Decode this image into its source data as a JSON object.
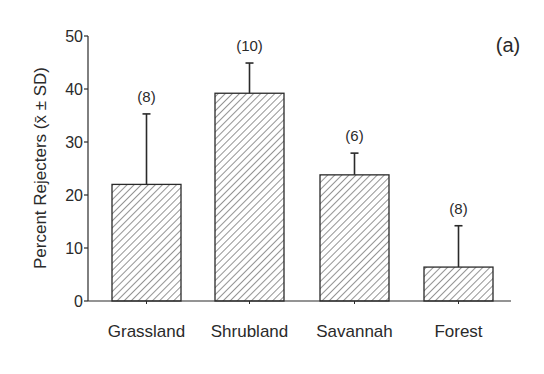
{
  "chart_data": {
    "type": "bar",
    "title": "",
    "panel_label": "(a)",
    "xlabel": "",
    "ylabel": "Percent Rejecters (x̄ ± SD)",
    "ylim": [
      0,
      50
    ],
    "yticks": [
      0,
      10,
      20,
      30,
      40,
      50
    ],
    "ytick_labels": [
      "0",
      "10",
      "20",
      "30",
      "40",
      "50"
    ],
    "grid": false,
    "legend": null,
    "bar_fill": "diagonal hatch",
    "categories": [
      "Grassland",
      "Shrubland",
      "Savannah",
      "Forest"
    ],
    "values": [
      22,
      39.2,
      23.8,
      6.4
    ],
    "error_upper": [
      13.3,
      5.7,
      4.1,
      7.8
    ],
    "sample_sizes": [
      "(8)",
      "(10)",
      "(6)",
      "(8)"
    ]
  },
  "colors": {
    "ink": "#2a2a2a",
    "background": "#ffffff"
  }
}
